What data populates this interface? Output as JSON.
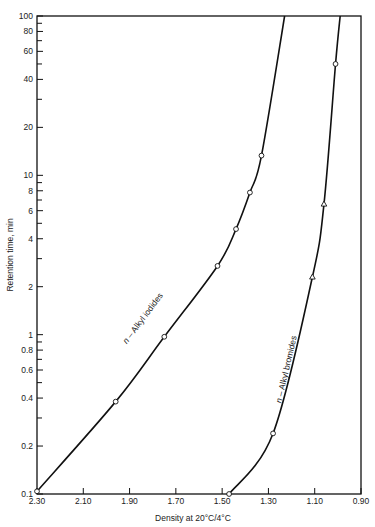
{
  "chart_data": {
    "type": "line",
    "title": "",
    "xlabel": "Density at 20°C/4°C",
    "ylabel": "Retention time, min",
    "xlim": [
      2.3,
      0.9
    ],
    "x_reversed": true,
    "ylim": [
      0.1,
      100
    ],
    "y_scale": "log",
    "grid": false,
    "legend": "none (inline curve labels)",
    "x_ticks": [
      "2.30",
      "2.10",
      "1.90",
      "1.70",
      "1.50",
      "1.30",
      "1.10",
      "0.90"
    ],
    "y_ticks": [
      "0.1",
      "0.2",
      "0.4",
      "0.6",
      "0.8",
      "1",
      "2",
      "4",
      "6",
      "8",
      "10",
      "20",
      "40",
      "60",
      "80",
      "100"
    ],
    "series": [
      {
        "name": "n-Alkyl iodides",
        "marker": "circle",
        "points": [
          {
            "x": 2.3,
            "y": 0.104
          },
          {
            "x": 1.96,
            "y": 0.38
          },
          {
            "x": 1.75,
            "y": 0.97
          },
          {
            "x": 1.52,
            "y": 2.7
          },
          {
            "x": 1.44,
            "y": 4.6
          },
          {
            "x": 1.38,
            "y": 7.8
          },
          {
            "x": 1.33,
            "y": 13.3
          }
        ],
        "curve_end": {
          "x": 1.23,
          "y": 100
        }
      },
      {
        "name": "n-Alkyl bromides",
        "marker": "triangle/circle",
        "points": [
          {
            "x": 1.47,
            "y": 0.1
          },
          {
            "x": 1.28,
            "y": 0.24
          },
          {
            "x": 1.11,
            "y": 2.3
          },
          {
            "x": 1.06,
            "y": 6.6
          },
          {
            "x": 1.01,
            "y": 50
          }
        ],
        "curve_end": {
          "x": 0.99,
          "y": 100
        }
      }
    ],
    "annotations": [
      "n-Alkyl iodides",
      "n-Alkyl bromides"
    ]
  }
}
